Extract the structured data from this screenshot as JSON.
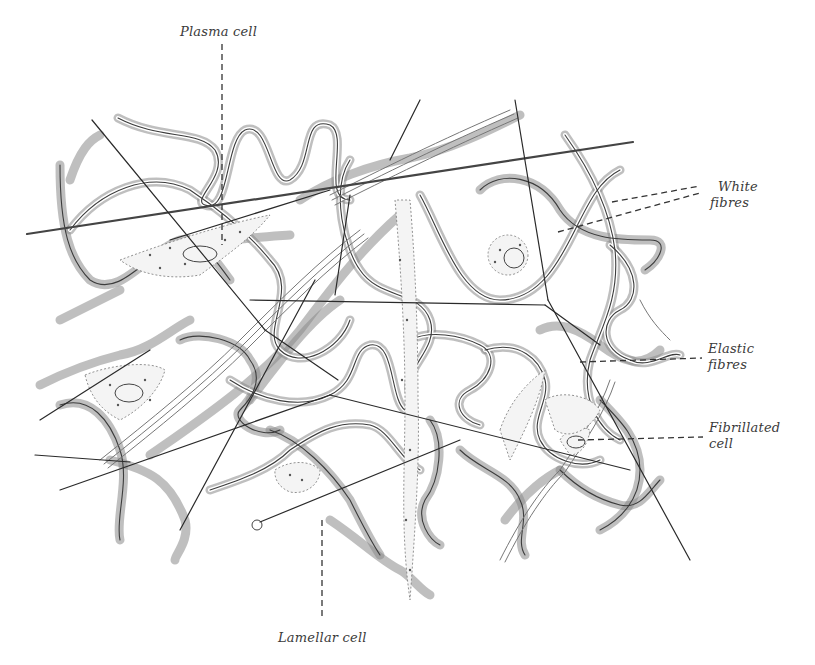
{
  "figure": {
    "labels": {
      "plasma_cell": "Plasma cell",
      "white_fibres_line1": "White",
      "white_fibres_line2": "fibres",
      "elastic_fibres_line1": "Elastic",
      "elastic_fibres_line2": "fibres",
      "fibrillated_cell_line1": "Fibrillated",
      "fibrillated_cell_line2": "cell",
      "lamellar_cell": "Lamellar cell"
    },
    "colors": {
      "background": "#ffffff",
      "ink": "#2a2a2a",
      "fibre_shade": "#8a8a8a"
    }
  }
}
